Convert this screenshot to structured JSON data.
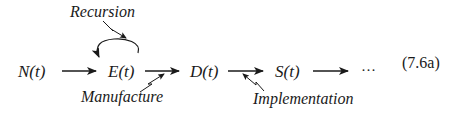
{
  "diagram": {
    "nodes": [
      {
        "id": "N",
        "label": "N(t)"
      },
      {
        "id": "E",
        "label": "E(t)"
      },
      {
        "id": "D",
        "label": "D(t)"
      },
      {
        "id": "S",
        "label": "S(t)"
      }
    ],
    "continuation": "···",
    "annotations": {
      "recursion": "Recursion",
      "manufacture": "Manufacture",
      "implementation": "Implementation"
    },
    "edges": [
      {
        "from": "N",
        "to": "E"
      },
      {
        "from": "E",
        "to": "E",
        "label": "Recursion",
        "type": "self-loop"
      },
      {
        "from": "E",
        "to": "D",
        "label": "Manufacture"
      },
      {
        "from": "D",
        "to": "S",
        "label": "Implementation"
      },
      {
        "from": "S",
        "to": "···"
      }
    ],
    "equation_number": "(7.6a)",
    "colors": {
      "ink": "#1a1a1a",
      "background": "#ffffff"
    }
  }
}
